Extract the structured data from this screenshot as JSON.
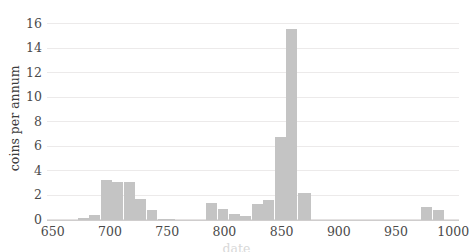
{
  "chart_data": {
    "type": "bar",
    "title": "",
    "subtitle": "",
    "xlabel": "date",
    "ylabel": "coins per annum",
    "xlim": [
      645,
      1005
    ],
    "ylim": [
      0,
      16.6
    ],
    "grid": true,
    "legend": null,
    "bar_color": "#c4c4c4",
    "bin_width": 10,
    "x_ticks": [
      650,
      700,
      750,
      800,
      850,
      900,
      950,
      1000
    ],
    "y_ticks": [
      0,
      2,
      4,
      6,
      8,
      10,
      12,
      14,
      16
    ],
    "categories": [
      675,
      685,
      695,
      705,
      715,
      725,
      735,
      745,
      785,
      795,
      805,
      815,
      825,
      835,
      845,
      855,
      865,
      975,
      985
    ],
    "values": [
      0.2,
      0.4,
      3.3,
      3.1,
      3.1,
      1.7,
      0.8,
      0.1,
      1.4,
      0.9,
      0.5,
      0.3,
      1.3,
      1.6,
      6.8,
      15.6,
      2.2,
      1.1,
      0.85
    ],
    "bars": [
      {
        "x0": 672,
        "x1": 682,
        "value": 0.2
      },
      {
        "x0": 682,
        "x1": 692,
        "value": 0.4
      },
      {
        "x0": 692,
        "x1": 702,
        "value": 3.3
      },
      {
        "x0": 702,
        "x1": 712,
        "value": 3.1
      },
      {
        "x0": 712,
        "x1": 722,
        "value": 3.1
      },
      {
        "x0": 722,
        "x1": 732,
        "value": 1.7
      },
      {
        "x0": 732,
        "x1": 742,
        "value": 0.8
      },
      {
        "x0": 742,
        "x1": 757,
        "value": 0.1
      },
      {
        "x0": 784,
        "x1": 794,
        "value": 1.4
      },
      {
        "x0": 794,
        "x1": 804,
        "value": 0.9
      },
      {
        "x0": 804,
        "x1": 814,
        "value": 0.5
      },
      {
        "x0": 814,
        "x1": 824,
        "value": 0.3
      },
      {
        "x0": 824,
        "x1": 834,
        "value": 1.3
      },
      {
        "x0": 834,
        "x1": 844,
        "value": 1.6
      },
      {
        "x0": 844,
        "x1": 854,
        "value": 6.8
      },
      {
        "x0": 854,
        "x1": 864,
        "value": 15.6
      },
      {
        "x0": 864,
        "x1": 876,
        "value": 2.2
      },
      {
        "x0": 972,
        "x1": 982,
        "value": 1.1
      },
      {
        "x0": 982,
        "x1": 992,
        "value": 0.85
      }
    ]
  }
}
